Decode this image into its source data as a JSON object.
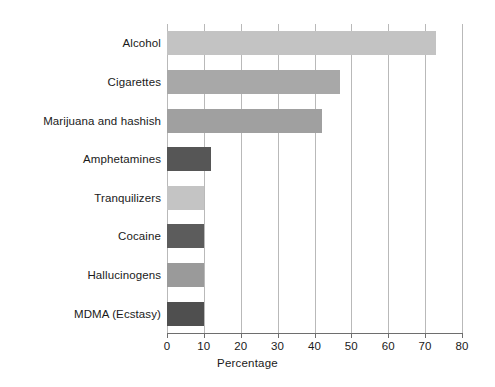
{
  "chart_data": {
    "type": "bar",
    "orientation": "horizontal",
    "title": "",
    "xlabel": "Percentage",
    "ylabel": "",
    "xlim": [
      0,
      80
    ],
    "xticks": [
      0,
      10,
      20,
      30,
      40,
      50,
      60,
      70,
      80
    ],
    "grid": "vertical",
    "legend": "none",
    "categories": [
      "Alcohol",
      "Cigarettes",
      "Marijuana and hashish",
      "Amphetamines",
      "Tranquilizers",
      "Cocaine",
      "Hallucinogens",
      "MDMA (Ecstasy)"
    ],
    "values": [
      73,
      47,
      42,
      12,
      10,
      10,
      10,
      10
    ],
    "bar_colors": [
      "#c3c3c3",
      "#a8a8a8",
      "#a0a0a0",
      "#565656",
      "#c4c4c4",
      "#5c5c5c",
      "#9a9a9a",
      "#4f4f4f"
    ]
  },
  "axis": {
    "tick_labels": [
      "0",
      "10",
      "20",
      "30",
      "40",
      "50",
      "60",
      "70",
      "80"
    ],
    "xlabel": "Percentage"
  }
}
